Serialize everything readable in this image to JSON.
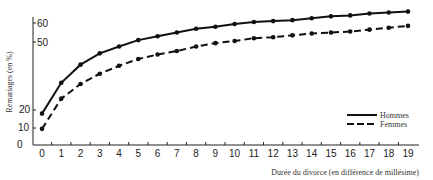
{
  "chart_data": {
    "type": "line",
    "title": "",
    "xlabel": "Durée du divorce (en différence de millésime)",
    "ylabel": "Remariages (en %)",
    "x": [
      0,
      1,
      2,
      3,
      4,
      5,
      6,
      7,
      8,
      9,
      10,
      11,
      12,
      13,
      14,
      15,
      16,
      17,
      18,
      19
    ],
    "x_tick_labels": [
      "0",
      "1",
      "2",
      "3",
      "4",
      "5",
      "6",
      "7",
      "8",
      "9",
      "10",
      "11",
      "12",
      "13",
      "14",
      "15",
      "16",
      "17",
      "18",
      "19"
    ],
    "y_tick_labels": [
      "0",
      "10",
      "20",
      "50",
      "60"
    ],
    "ylim": [
      0,
      66
    ],
    "grid": false,
    "legend_position": "right, above x-axis",
    "series": [
      {
        "name": "Hommes",
        "style": "solid",
        "marker": "dot",
        "values": [
          18,
          32,
          40,
          45,
          48,
          51,
          53,
          55,
          57,
          58,
          59.5,
          60.5,
          61,
          61.5,
          62.5,
          63.5,
          64,
          65,
          65.5,
          66
        ]
      },
      {
        "name": "Femmes",
        "style": "dashed",
        "marker": "dot",
        "values": [
          9.5,
          25,
          31.5,
          36,
          39.5,
          42.5,
          44.5,
          46,
          48,
          49.5,
          50.5,
          52,
          52.5,
          53.5,
          54.5,
          55,
          55.5,
          56.5,
          57.5,
          58.5
        ]
      }
    ]
  },
  "legend": {
    "items": [
      {
        "label": "Hommes",
        "style": "solid"
      },
      {
        "label": "Femmes",
        "style": "dashed"
      }
    ]
  },
  "colors": {
    "line": "#111111",
    "axis": "#222222",
    "background": "#ffffff"
  }
}
